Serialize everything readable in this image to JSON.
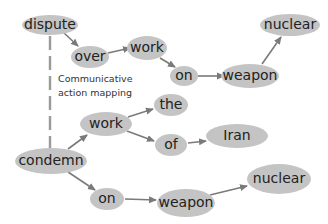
{
  "diagram": {
    "type": "dependency-graph-mapping",
    "colors": {
      "node_fill": "#c4c4c4",
      "node_text": "#222222",
      "edge": "#7a7a7a",
      "mapping_line": "#9a9a9a"
    },
    "mapping": {
      "label_line1": "Communicative",
      "label_line2": "action mapping",
      "from": "dispute",
      "to": "condemn",
      "style": "dashed"
    },
    "top_tree": {
      "nodes": [
        {
          "id": "dispute",
          "label": "dispute"
        },
        {
          "id": "over",
          "label": "over"
        },
        {
          "id": "work_top",
          "label": "work"
        },
        {
          "id": "on_top",
          "label": "on"
        },
        {
          "id": "weapon_top",
          "label": "weapon"
        },
        {
          "id": "nuclear_top",
          "label": "nuclear"
        }
      ],
      "edges": [
        {
          "from": "dispute",
          "to": "over"
        },
        {
          "from": "over",
          "to": "work_top"
        },
        {
          "from": "work_top",
          "to": "on_top"
        },
        {
          "from": "on_top",
          "to": "weapon_top"
        },
        {
          "from": "weapon_top",
          "to": "nuclear_top"
        }
      ]
    },
    "bottom_tree": {
      "nodes": [
        {
          "id": "condemn",
          "label": "condemn"
        },
        {
          "id": "work_bottom",
          "label": "work"
        },
        {
          "id": "the",
          "label": "the"
        },
        {
          "id": "of",
          "label": "of"
        },
        {
          "id": "iran",
          "label": "Iran"
        },
        {
          "id": "on_bottom",
          "label": "on"
        },
        {
          "id": "weapon_bottom",
          "label": "weapon"
        },
        {
          "id": "nuclear_bottom",
          "label": "nuclear"
        }
      ],
      "edges": [
        {
          "from": "condemn",
          "to": "work_bottom"
        },
        {
          "from": "work_bottom",
          "to": "the"
        },
        {
          "from": "work_bottom",
          "to": "of"
        },
        {
          "from": "of",
          "to": "iran"
        },
        {
          "from": "condemn",
          "to": "on_bottom"
        },
        {
          "from": "on_bottom",
          "to": "weapon_bottom"
        },
        {
          "from": "weapon_bottom",
          "to": "nuclear_bottom"
        }
      ]
    }
  }
}
